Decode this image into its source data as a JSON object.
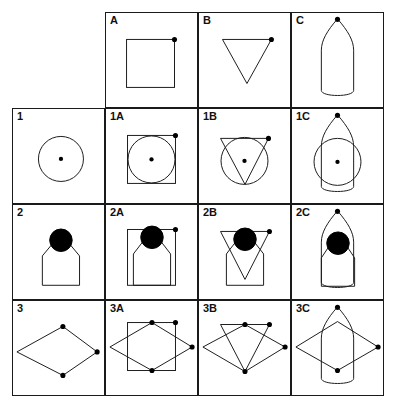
{
  "page": {
    "background_color": "#ffffff",
    "stroke_color": "#1a1a1a",
    "fill_color": "#000000",
    "columns": [
      "",
      "A",
      "B",
      "C"
    ],
    "rows": [
      "",
      "1",
      "2",
      "3"
    ]
  },
  "grid": {
    "column_headers": [
      {
        "label": "A",
        "shape": "square"
      },
      {
        "label": "B",
        "shape": "inverted-triangle"
      },
      {
        "label": "C",
        "shape": "bullet"
      }
    ],
    "row_headers": [
      {
        "label": "1",
        "shape": "circle"
      },
      {
        "label": "2",
        "shape": "tag-with-ball"
      },
      {
        "label": "3",
        "shape": "rhombus"
      }
    ],
    "cells": [
      {
        "label": "",
        "name": "cell-empty-corner",
        "shapes": [],
        "bordered": false
      },
      {
        "label": "A",
        "name": "cell-a",
        "shapes": [
          "square"
        ],
        "bordered": true
      },
      {
        "label": "B",
        "name": "cell-b",
        "shapes": [
          "inverted-triangle"
        ],
        "bordered": true
      },
      {
        "label": "C",
        "name": "cell-c",
        "shapes": [
          "bullet"
        ],
        "bordered": true
      },
      {
        "label": "1",
        "name": "cell-1",
        "shapes": [
          "circle"
        ],
        "bordered": true
      },
      {
        "label": "1A",
        "name": "cell-1a",
        "shapes": [
          "circle",
          "square"
        ],
        "bordered": true
      },
      {
        "label": "1B",
        "name": "cell-1b",
        "shapes": [
          "circle",
          "inverted-triangle"
        ],
        "bordered": true
      },
      {
        "label": "1C",
        "name": "cell-1c",
        "shapes": [
          "circle",
          "bullet"
        ],
        "bordered": true
      },
      {
        "label": "2",
        "name": "cell-2",
        "shapes": [
          "tag-with-ball"
        ],
        "bordered": true
      },
      {
        "label": "2A",
        "name": "cell-2a",
        "shapes": [
          "tag-with-ball",
          "square"
        ],
        "bordered": true
      },
      {
        "label": "2B",
        "name": "cell-2b",
        "shapes": [
          "tag-with-ball",
          "inverted-triangle"
        ],
        "bordered": true
      },
      {
        "label": "2C",
        "name": "cell-2c",
        "shapes": [
          "tag-with-ball",
          "bullet"
        ],
        "bordered": true
      },
      {
        "label": "3",
        "name": "cell-3",
        "shapes": [
          "rhombus"
        ],
        "bordered": true
      },
      {
        "label": "3A",
        "name": "cell-3a",
        "shapes": [
          "rhombus",
          "square"
        ],
        "bordered": true
      },
      {
        "label": "3B",
        "name": "cell-3b",
        "shapes": [
          "rhombus",
          "inverted-triangle"
        ],
        "bordered": true
      },
      {
        "label": "3C",
        "name": "cell-3c",
        "shapes": [
          "rhombus",
          "bullet"
        ],
        "bordered": true
      }
    ]
  },
  "labels": {
    "corner": "",
    "a": "A",
    "b": "B",
    "c": "C",
    "r1": "1",
    "r1a": "1A",
    "r1b": "1B",
    "r1c": "1C",
    "r2": "2",
    "r2a": "2A",
    "r2b": "2B",
    "r2c": "2C",
    "r3": "3",
    "r3a": "3A",
    "r3b": "3B",
    "r3c": "3C"
  }
}
